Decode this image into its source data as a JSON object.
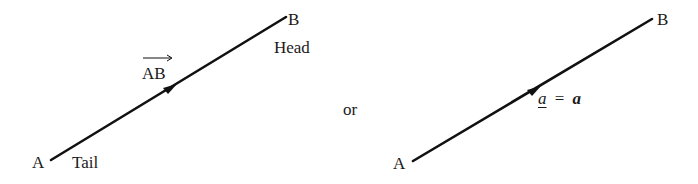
{
  "diagram": {
    "left_vector": {
      "tail_point": "A",
      "head_point": "B",
      "tail_label": "Tail",
      "head_label": "Head",
      "name": "AB",
      "notation": "overarrow"
    },
    "separator": "or",
    "right_vector": {
      "tail_point": "A",
      "head_point": "B",
      "underlined_name": "a",
      "equals": "=",
      "bold_name": "a"
    },
    "colors": {
      "line": "#111111",
      "text": "#1a1a1a",
      "background": "#ffffff"
    }
  }
}
